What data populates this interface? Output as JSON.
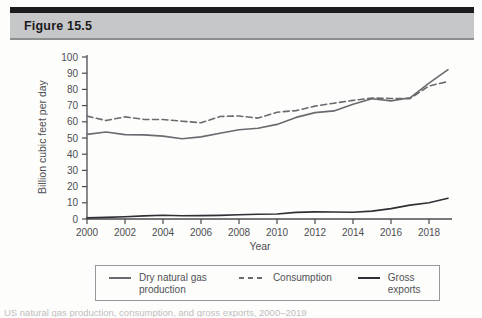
{
  "header": {
    "figure_label": "Figure 15.5"
  },
  "chart_data": {
    "type": "line",
    "title": "",
    "xlabel": "Year",
    "ylabel": "Billion cubic feet per day",
    "ylim": [
      0,
      100
    ],
    "xlim": [
      2000,
      2019
    ],
    "grid": false,
    "legend_position": "bottom",
    "y_ticks": [
      0,
      10,
      20,
      30,
      40,
      50,
      60,
      70,
      80,
      90,
      100
    ],
    "x_ticks": [
      2000,
      2002,
      2004,
      2006,
      2008,
      2010,
      2012,
      2014,
      2016,
      2018
    ],
    "x": [
      2000,
      2001,
      2002,
      2003,
      2004,
      2005,
      2006,
      2007,
      2008,
      2009,
      2010,
      2011,
      2012,
      2013,
      2014,
      2015,
      2016,
      2017,
      2018,
      2019
    ],
    "series": [
      {
        "name": "Dry natural gas production",
        "style": "solid",
        "color": "#6a6b6e",
        "values": [
          52.2,
          53.7,
          52.1,
          51.9,
          51.2,
          49.5,
          50.7,
          52.9,
          55.1,
          56.0,
          58.4,
          62.7,
          65.7,
          66.7,
          70.8,
          74.2,
          72.9,
          74.8,
          83.8,
          92.2
        ]
      },
      {
        "name": "Consumption",
        "style": "dashed",
        "color": "#6a6b6e",
        "values": [
          63.5,
          60.8,
          63.0,
          61.5,
          61.4,
          60.4,
          59.4,
          63.3,
          63.6,
          62.3,
          65.9,
          66.9,
          69.7,
          71.5,
          73.2,
          74.7,
          74.4,
          74.3,
          82.1,
          84.9
        ]
      },
      {
        "name": "Gross exports",
        "style": "solid",
        "color": "#2f3033",
        "values": [
          0.7,
          1.0,
          1.4,
          1.9,
          2.3,
          2.0,
          2.1,
          2.2,
          2.6,
          2.9,
          3.1,
          4.1,
          4.4,
          4.3,
          4.2,
          4.9,
          6.4,
          8.6,
          10.0,
          12.8
        ]
      }
    ],
    "axis_color": "#4b4c4f"
  },
  "caption_partial": "US natural gas production, consumption, and gross exports, 2000–2019"
}
